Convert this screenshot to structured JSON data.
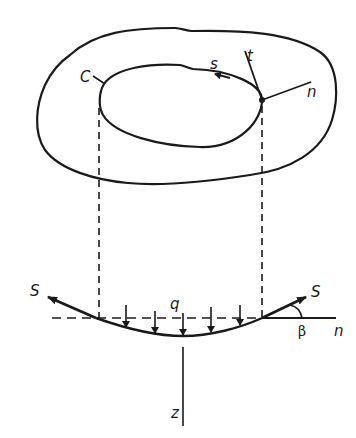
{
  "figure": {
    "type": "membrane-boundary-diagram",
    "top_view": {
      "contour_label": "C",
      "tangent_label": "s",
      "out_of_plane_label": "t",
      "normal_label": "n"
    },
    "section_view": {
      "load_label": "q",
      "tension_left_label": "S",
      "tension_right_label": "S",
      "angle_label": "β",
      "horizontal_axis_label": "n",
      "vertical_axis_label": "z",
      "load_arrow_count": 5
    },
    "colors": {
      "ink": "#1a1a1a",
      "background": "#ffffff"
    }
  }
}
